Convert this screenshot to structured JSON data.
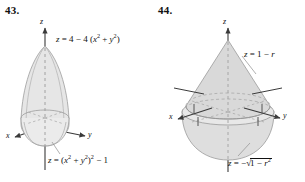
{
  "page": {
    "background_color": "#ffffff",
    "ink_color": "#111111",
    "surface_fill": "#e3e3e3",
    "surface_stroke": "#9a9a9a",
    "axis_color": "#3a3a3a"
  },
  "figures": [
    {
      "number": "43.",
      "axes": {
        "x": "x",
        "y": "y",
        "z": "z"
      },
      "labels": {
        "top_equation": {
          "lhs": "z",
          "rhs_text": "= 4 − 4 (x2 + y2)"
        },
        "bottom_equation": {
          "lhs": "z",
          "rhs_text": "= (x2 + y2)2 − 1"
        }
      },
      "description": "Solid bounded above by paraboloid z = 4 - 4(x^2+y^2) and below by z = (x^2+y^2)^2 - 1"
    },
    {
      "number": "44.",
      "axes": {
        "x": "x",
        "y": "y",
        "z": "z"
      },
      "labels": {
        "top_equation": {
          "lhs": "z",
          "rhs_text": "= 1 − r"
        },
        "bottom_equation": {
          "lhs": "z",
          "rhs_text": "= −√(1 − r2)"
        }
      },
      "description": "Ice-cream-cone solid: cone z = 1 - r above hemisphere z = -sqrt(1 - r^2)"
    }
  ]
}
